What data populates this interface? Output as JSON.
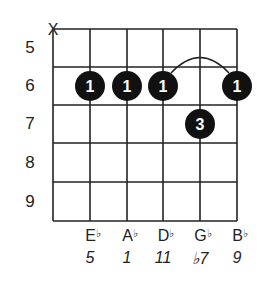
{
  "chart_data": {
    "type": "chord-diagram",
    "title": "",
    "strings": 6,
    "muted_strings": [
      1
    ],
    "fret_labels": [
      "5",
      "6",
      "7",
      "8",
      "9"
    ],
    "dots": [
      {
        "string": 2,
        "fret": "6",
        "finger": "1"
      },
      {
        "string": 3,
        "fret": "6",
        "finger": "1"
      },
      {
        "string": 4,
        "fret": "6",
        "finger": "1"
      },
      {
        "string": 6,
        "fret": "6",
        "finger": "1"
      },
      {
        "string": 5,
        "fret": "7",
        "finger": "3"
      }
    ],
    "barre": {
      "fret": "6",
      "from_string": 4,
      "to_string": 6
    },
    "notes": [
      {
        "string": 2,
        "letter": "E",
        "accidental": "♭"
      },
      {
        "string": 3,
        "letter": "A",
        "accidental": "♭"
      },
      {
        "string": 4,
        "letter": "D",
        "accidental": "♭"
      },
      {
        "string": 5,
        "letter": "G",
        "accidental": "♭"
      },
      {
        "string": 6,
        "letter": "B",
        "accidental": "♭"
      }
    ],
    "intervals": [
      {
        "string": 2,
        "value": "5"
      },
      {
        "string": 3,
        "value": "1"
      },
      {
        "string": 4,
        "value": "11"
      },
      {
        "string": 5,
        "value": "♭7"
      },
      {
        "string": 6,
        "value": "9"
      }
    ]
  },
  "muted_marker": "X",
  "colors": {
    "grid": "#222222",
    "dot": "#111111",
    "dot_text": "#ffffff"
  }
}
